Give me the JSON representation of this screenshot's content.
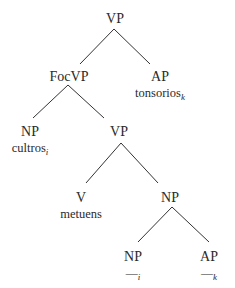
{
  "tree": {
    "root": {
      "label": "VP"
    },
    "focvp": {
      "label": "FocVP"
    },
    "ap_top": {
      "label": "AP",
      "word": "tonsorios",
      "index": "k"
    },
    "np_top": {
      "label": "NP",
      "word": "cultros",
      "index": "i"
    },
    "vp_inner": {
      "label": "VP"
    },
    "v": {
      "label": "V",
      "word": "metuens"
    },
    "np_mid": {
      "label": "NP"
    },
    "np_trace": {
      "label": "NP",
      "trace": "—",
      "index": "i"
    },
    "ap_trace": {
      "label": "AP",
      "trace": "—",
      "index": "k"
    }
  },
  "edges": [
    [
      "root",
      "focvp"
    ],
    [
      "root",
      "ap_top"
    ],
    [
      "focvp",
      "np_top"
    ],
    [
      "focvp",
      "vp_inner"
    ],
    [
      "vp_inner",
      "v"
    ],
    [
      "vp_inner",
      "np_mid"
    ],
    [
      "np_mid",
      "np_trace"
    ],
    [
      "np_mid",
      "ap_trace"
    ]
  ]
}
